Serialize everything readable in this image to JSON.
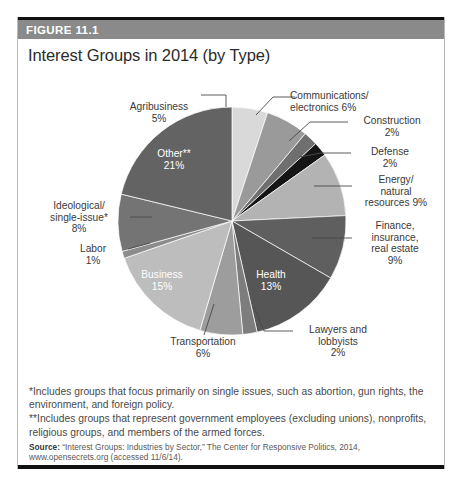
{
  "figure": {
    "number_label": "FIGURE 11.1",
    "title": "Interest Groups in 2014 (by Type)"
  },
  "notes": {
    "single_asterisk": "*Includes groups that focus primarily on single issues, such as abortion, gun rights, the environment, and foreign policy.",
    "double_asterisk": "**Includes groups that represent government employees (excluding unions), nonprofits, religious groups, and members of the armed forces.",
    "source_prefix": "Source:",
    "source_text": " “Interest Groups: Industries by Sector,” The Center for Responsive Politics, 2014, www.opensecrets.org (accessed 11/6/14)."
  },
  "chart_data": {
    "type": "pie",
    "title": "Interest Groups in 2014 (by Type)",
    "xlabel": "",
    "ylabel": "",
    "units": "percent",
    "start_angle_deg": 0,
    "direction": "clockwise",
    "legend_position": "none",
    "grid": false,
    "categories": [
      "Agribusiness",
      "Communications/electronics",
      "Construction",
      "Defense",
      "Energy/natural resources",
      "Finance, insurance, real estate",
      "Health",
      "Lawyers and lobbyists",
      "Transportation",
      "Business",
      "Labor",
      "Ideological/single-issue*",
      "Other**"
    ],
    "values": [
      5,
      6,
      2,
      2,
      9,
      9,
      13,
      2,
      6,
      15,
      1,
      8,
      21
    ],
    "colors": [
      "#d9d9d9",
      "#9a9a9a",
      "#6f6f6f",
      "#151515",
      "#b3b3b3",
      "#5f5f5f",
      "#565656",
      "#7d7d7d",
      "#9d9d9d",
      "#bdbdbd",
      "#8c8c8c",
      "#747474",
      "#636363"
    ],
    "slices": [
      {
        "name": "Agribusiness",
        "value": 5,
        "label_text": "Agribusiness",
        "label_pct": "5%",
        "label_placement": "outside-top-left",
        "color": "#d9d9d9"
      },
      {
        "name": "Communications/electronics",
        "value": 6,
        "label_text": "Communications/\nelectronics 6%",
        "label_line1": "Communications/",
        "label_line2": "electronics 6%",
        "label_placement": "outside-top-right",
        "color": "#9a9a9a"
      },
      {
        "name": "Construction",
        "value": 2,
        "label_text": "Construction",
        "label_pct": "2%",
        "label_placement": "outside-right",
        "color": "#6f6f6f"
      },
      {
        "name": "Defense",
        "value": 2,
        "label_text": "Defense",
        "label_pct": "2%",
        "label_placement": "outside-right",
        "color": "#151515"
      },
      {
        "name": "Energy/natural resources",
        "value": 9,
        "label_line1": "Energy/",
        "label_line2": "natural",
        "label_line3": "resources 9%",
        "label_placement": "outside-right",
        "color": "#b3b3b3"
      },
      {
        "name": "Finance, insurance, real estate",
        "value": 9,
        "label_line1": "Finance,",
        "label_line2": "insurance,",
        "label_line3": "real estate",
        "label_line4": "9%",
        "label_placement": "outside-right",
        "color": "#5f5f5f"
      },
      {
        "name": "Health",
        "value": 13,
        "label_text": "Health",
        "label_pct": "13%",
        "label_placement": "inside",
        "color": "#565656"
      },
      {
        "name": "Lawyers and lobbyists",
        "value": 2,
        "label_line1": "Lawyers and",
        "label_line2": "lobbyists",
        "label_line3": "2%",
        "label_placement": "outside-bottom-right",
        "color": "#7d7d7d"
      },
      {
        "name": "Transportation",
        "value": 6,
        "label_text": "Transportation",
        "label_pct": "6%",
        "label_placement": "outside-bottom",
        "color": "#9d9d9d"
      },
      {
        "name": "Business",
        "value": 15,
        "label_text": "Business",
        "label_pct": "15%",
        "label_placement": "inside",
        "color": "#bdbdbd"
      },
      {
        "name": "Labor",
        "value": 1,
        "label_text": "Labor",
        "label_pct": "1%",
        "label_placement": "outside-left",
        "color": "#8c8c8c"
      },
      {
        "name": "Ideological/single-issue*",
        "value": 8,
        "label_line1": "Ideological/",
        "label_line2": "single-issue*",
        "label_line3": "8%",
        "label_placement": "outside-left",
        "color": "#747474"
      },
      {
        "name": "Other**",
        "value": 21,
        "label_text": "Other**",
        "label_pct": "21%",
        "label_placement": "inside",
        "color": "#636363"
      }
    ]
  }
}
